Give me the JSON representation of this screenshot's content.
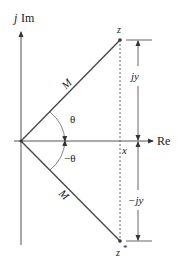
{
  "diagram": {
    "axes": {
      "imag_label_j": "j",
      "imag_label": "Im",
      "real_label": "Re"
    },
    "points": {
      "z": "z",
      "z_conj": "z",
      "z_conj_sup": "*"
    },
    "vectors": {
      "upper_magnitude": "M",
      "lower_magnitude": "M"
    },
    "angles": {
      "upper": "θ",
      "lower": "−θ"
    },
    "dimensions": {
      "x": "x",
      "upper_height": "jy",
      "lower_height": "−jy"
    },
    "colors": {
      "line": "#444444",
      "text": "#222222",
      "background": "#ffffff"
    }
  }
}
